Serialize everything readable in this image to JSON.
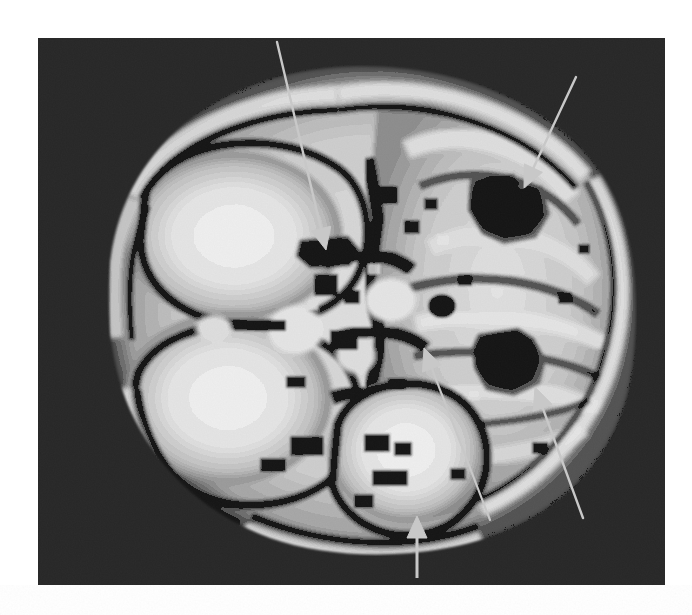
{
  "figure": {
    "kind": "medical-scan-figure",
    "modality_appearance": "grayscale axial brain scan",
    "orientation": "axial",
    "panel": {
      "left": 38,
      "top": 38,
      "width": 627,
      "height": 547,
      "background_color": "#161616"
    },
    "page_background_color": "#ffffff"
  },
  "image": {
    "alt": "Axial grayscale brain scan showing hypointense lesion foci indicated by arrows",
    "grayscale": {
      "background": "#161616",
      "dark_tissue": "#2a2a2a",
      "mid_tissue": "#8a8a8a",
      "bright_tissue": "#e8e8e8",
      "hot_tissue": "#fdfdfd",
      "lesion_dark": "#242424",
      "lesion_core": "#3a3a3a"
    }
  },
  "annotations": {
    "arrow_color": "#c8c8c8",
    "arrows": [
      {
        "id": "arrow-1",
        "name": "arrow-anterior-midline",
        "target": "left frontal / anterior midline hypointensity",
        "tail": [
          239,
          4
        ],
        "tip": [
          288,
          212
        ],
        "head": "solid-triangle",
        "style": "long-thin-line"
      },
      {
        "id": "arrow-2",
        "name": "arrow-right-frontal-lesion",
        "target": "right frontal lesion (upper right dark focus)",
        "tail": [
          538,
          39
        ],
        "tip": [
          486,
          150
        ],
        "head": "solid-triangle",
        "style": "long-thin-line"
      },
      {
        "id": "arrow-3",
        "name": "arrow-right-temporal-lesion",
        "target": "right temporal lesion (lower right dark focus)",
        "tail": [
          545,
          480
        ],
        "tip": [
          497,
          349
        ],
        "head": "solid-triangle",
        "style": "long-thin-line"
      },
      {
        "id": "arrow-4",
        "name": "arrow-posterior-midline",
        "target": "posterior midline / brainstem region",
        "tail": [
          452,
          482
        ],
        "tip": [
          386,
          310
        ],
        "head": "solid-triangle",
        "style": "long-thin-line"
      },
      {
        "id": "arrow-5",
        "name": "arrow-inferior-vertical",
        "target": "inferior occipital margin",
        "tail": [
          379,
          540
        ],
        "tip": [
          379,
          478
        ],
        "head": "solid-triangle",
        "style": "short-vertical-line"
      }
    ]
  },
  "lesions": [
    {
      "id": "lesion-1",
      "name": "right-frontal-lesion",
      "center": [
        470,
        172
      ],
      "radius_x": 44,
      "radius_y": 36,
      "description": "dark signal focus, upper right hemisphere"
    },
    {
      "id": "lesion-2",
      "name": "right-temporal-lesion",
      "center": [
        478,
        324
      ],
      "radius_x": 42,
      "radius_y": 34,
      "description": "dark signal focus, lower right hemisphere"
    },
    {
      "id": "lesion-3",
      "name": "anterior-midline-focus",
      "center": [
        290,
        215
      ],
      "radius_x": 28,
      "radius_y": 16,
      "description": "small dark focus at arrow-1 tip"
    }
  ]
}
